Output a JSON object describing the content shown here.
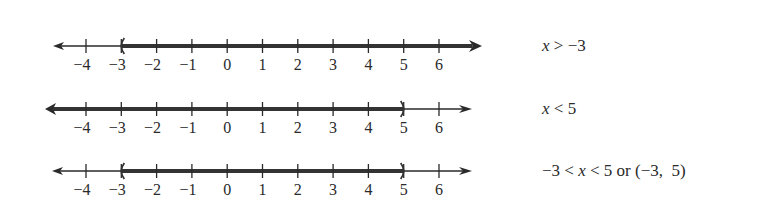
{
  "axis": {
    "ticks": [
      -4,
      -3,
      -2,
      -1,
      0,
      1,
      2,
      3,
      4,
      5,
      6
    ],
    "tick_labels": [
      "−4",
      "−3",
      "−2",
      "−1",
      "0",
      "1",
      "2",
      "3",
      "4",
      "5",
      "6"
    ],
    "x_of_minus4": 86,
    "unit_px": 35.3
  },
  "colors": {
    "axis_line": "#2a2a2a",
    "shaded": "#333333",
    "text": "#2a2a2a"
  },
  "number_lines": [
    {
      "id": "line-1",
      "y": 46,
      "left_tip": 53,
      "right_tip": 482,
      "shade_from": -3,
      "shade_to": "inf",
      "left_endpoint": "(",
      "right_endpoint": "arrow",
      "expression_parts": [
        {
          "text": "x",
          "italic": true
        },
        {
          "text": " > −3",
          "italic": false
        }
      ]
    },
    {
      "id": "line-2",
      "y": 109,
      "left_tip": 45,
      "right_tip": 472,
      "shade_from": "-inf",
      "shade_to": 5,
      "left_endpoint": "arrow",
      "right_endpoint": ")",
      "expression_parts": [
        {
          "text": "x",
          "italic": true
        },
        {
          "text": " < 5",
          "italic": false
        }
      ]
    },
    {
      "id": "line-3",
      "y": 171,
      "left_tip": 52,
      "right_tip": 472,
      "shade_from": -3,
      "shade_to": 5,
      "left_endpoint": "(",
      "right_endpoint": ")",
      "expression_parts": [
        {
          "text": "−3 < ",
          "italic": false
        },
        {
          "text": "x",
          "italic": true
        },
        {
          "text": " < 5 or (−3,  5)",
          "italic": false
        }
      ]
    }
  ]
}
